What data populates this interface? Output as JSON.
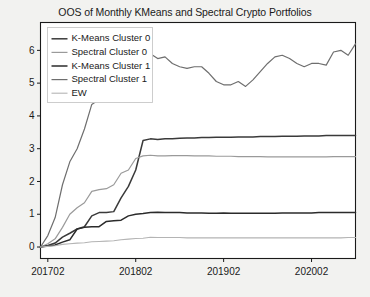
{
  "chart_data": {
    "type": "line",
    "title": "OOS of Monthly KMeans and Spectral Crypto Portfolios",
    "xlabel": "",
    "ylabel": "",
    "xlim": [
      201701,
      202009
    ],
    "ylim": [
      -0.35,
      6.85
    ],
    "grid": false,
    "legend_position": "upper left",
    "xticks": [
      "201702",
      "201802",
      "201902",
      "202002"
    ],
    "xtick_values": [
      201702,
      201802,
      201902,
      202002
    ],
    "yticks": [
      "0",
      "1",
      "2",
      "3",
      "4",
      "5",
      "6"
    ],
    "ytick_values": [
      0,
      1,
      2,
      3,
      4,
      5,
      6
    ],
    "x": [
      201701,
      201702,
      201703,
      201704,
      201705,
      201706,
      201707,
      201708,
      201709,
      201710,
      201711,
      201712,
      201801,
      201802,
      201803,
      201804,
      201805,
      201806,
      201807,
      201808,
      201809,
      201810,
      201811,
      201812,
      201901,
      201902,
      201903,
      201904,
      201905,
      201906,
      201907,
      201908,
      201909,
      201910,
      201911,
      201912,
      202001,
      202002,
      202003,
      202004,
      202005,
      202006,
      202007,
      202008
    ],
    "series": [
      {
        "name": "K-Means Cluster 0",
        "color": "#3a3a3a",
        "width": 1.5,
        "values": [
          0.0,
          0.05,
          0.12,
          0.3,
          0.42,
          0.55,
          0.62,
          0.95,
          1.05,
          1.05,
          1.08,
          1.5,
          1.85,
          2.35,
          3.25,
          3.3,
          3.28,
          3.3,
          3.3,
          3.32,
          3.33,
          3.33,
          3.34,
          3.34,
          3.35,
          3.35,
          3.35,
          3.36,
          3.36,
          3.36,
          3.37,
          3.37,
          3.37,
          3.38,
          3.38,
          3.38,
          3.39,
          3.39,
          3.39,
          3.4,
          3.4,
          3.4,
          3.4,
          3.4
        ]
      },
      {
        "name": "Spectral Cluster 0",
        "color": "#9a9a9a",
        "width": 1.2,
        "values": [
          0.0,
          0.1,
          0.25,
          0.6,
          1.0,
          1.2,
          1.35,
          1.7,
          1.75,
          1.78,
          1.9,
          2.25,
          2.35,
          2.7,
          2.78,
          2.8,
          2.78,
          2.78,
          2.79,
          2.79,
          2.79,
          2.78,
          2.78,
          2.78,
          2.77,
          2.77,
          2.77,
          2.76,
          2.76,
          2.76,
          2.76,
          2.75,
          2.75,
          2.75,
          2.75,
          2.75,
          2.75,
          2.75,
          2.75,
          2.75,
          2.76,
          2.76,
          2.76,
          2.76
        ]
      },
      {
        "name": "K-Means Cluster 1",
        "color": "#2b2b2b",
        "width": 1.5,
        "values": [
          0.0,
          0.03,
          0.06,
          0.15,
          0.22,
          0.55,
          0.6,
          0.62,
          0.62,
          0.78,
          0.8,
          0.82,
          0.95,
          1.0,
          1.02,
          1.05,
          1.06,
          1.05,
          1.05,
          1.05,
          1.04,
          1.04,
          1.04,
          1.03,
          1.03,
          1.04,
          1.03,
          1.03,
          1.03,
          1.03,
          1.03,
          1.03,
          1.03,
          1.04,
          1.04,
          1.04,
          1.04,
          1.04,
          1.05,
          1.05,
          1.05,
          1.05,
          1.05,
          1.05
        ]
      },
      {
        "name": "Spectral Cluster 1",
        "color": "#6e6e6e",
        "width": 1.2,
        "values": [
          0.0,
          0.35,
          0.9,
          1.9,
          2.6,
          3.0,
          3.6,
          4.35,
          4.5,
          4.8,
          5.2,
          5.75,
          6.25,
          6.6,
          6.2,
          5.9,
          5.75,
          5.8,
          5.6,
          5.5,
          5.45,
          5.5,
          5.5,
          5.3,
          5.05,
          4.95,
          4.95,
          5.05,
          4.9,
          5.1,
          5.35,
          5.6,
          5.8,
          5.85,
          5.75,
          5.6,
          5.5,
          5.6,
          5.6,
          5.55,
          5.95,
          6.0,
          5.85,
          6.2
        ]
      },
      {
        "name": "EW",
        "color": "#b4b4b4",
        "width": 1.1,
        "values": [
          0.0,
          0.02,
          0.04,
          0.08,
          0.1,
          0.12,
          0.13,
          0.16,
          0.17,
          0.18,
          0.19,
          0.22,
          0.24,
          0.26,
          0.27,
          0.3,
          0.29,
          0.29,
          0.29,
          0.29,
          0.28,
          0.28,
          0.28,
          0.28,
          0.28,
          0.28,
          0.28,
          0.28,
          0.28,
          0.28,
          0.28,
          0.28,
          0.28,
          0.28,
          0.28,
          0.28,
          0.28,
          0.28,
          0.28,
          0.28,
          0.28,
          0.28,
          0.29,
          0.29
        ]
      }
    ]
  }
}
